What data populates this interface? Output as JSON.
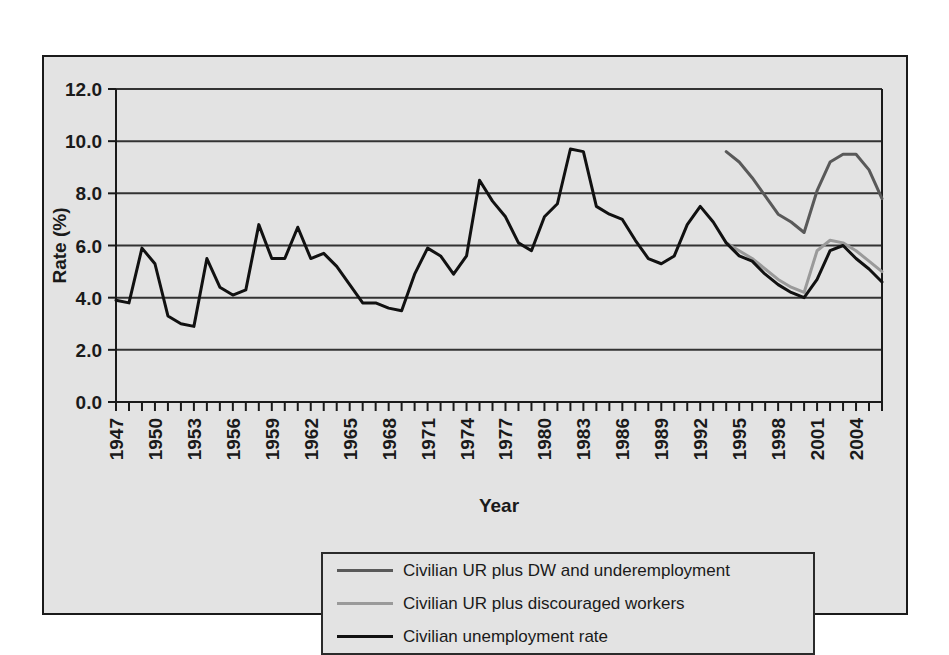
{
  "chart_data": {
    "type": "line",
    "title": "",
    "xlabel": "Year",
    "ylabel": "Rate (%)",
    "xlim": [
      1947,
      2006
    ],
    "ylim": [
      0.0,
      12.0
    ],
    "ytick_values": [
      0.0,
      2.0,
      4.0,
      6.0,
      8.0,
      10.0,
      12.0
    ],
    "ytick_labels": [
      "0.0",
      "2.0",
      "4.0",
      "6.0",
      "8.0",
      "10.0",
      "12.0"
    ],
    "xtick_labels": [
      "1947",
      "1950",
      "1953",
      "1956",
      "1959",
      "1962",
      "1965",
      "1968",
      "1971",
      "1974",
      "1977",
      "1980",
      "1983",
      "1986",
      "1989",
      "1992",
      "1995",
      "1998",
      "2001",
      "2004"
    ],
    "xtick_step": 3,
    "xtick_rotation": 90,
    "minor_tick_step": 1,
    "grid": "horizontal",
    "legend_position": "below-axes",
    "series": [
      {
        "name": "Civilian UR plus DW and underemployment",
        "color": "#595959",
        "x": [
          1994,
          1995,
          1996,
          1997,
          1998,
          1999,
          2000,
          2001,
          2002,
          2003,
          2004,
          2005,
          2006
        ],
        "values": [
          9.6,
          9.2,
          8.6,
          7.9,
          7.2,
          6.9,
          6.5,
          8.1,
          9.2,
          9.5,
          9.5,
          8.9,
          7.8
        ]
      },
      {
        "name": "Civilian UR plus discouraged workers",
        "color": "#9a9a9a",
        "x": [
          1994,
          1995,
          1996,
          1997,
          1998,
          1999,
          2000,
          2001,
          2002,
          2003,
          2004,
          2005,
          2006
        ],
        "values": [
          6.1,
          5.8,
          5.5,
          5.1,
          4.7,
          4.4,
          4.2,
          5.8,
          6.2,
          6.1,
          5.8,
          5.4,
          5.0
        ]
      },
      {
        "name": "Civilian unemployment rate",
        "color": "#111111",
        "x": [
          1947,
          1948,
          1949,
          1950,
          1951,
          1952,
          1953,
          1954,
          1955,
          1956,
          1957,
          1958,
          1959,
          1960,
          1961,
          1962,
          1963,
          1964,
          1965,
          1966,
          1967,
          1968,
          1969,
          1970,
          1971,
          1972,
          1973,
          1974,
          1975,
          1976,
          1977,
          1978,
          1979,
          1980,
          1981,
          1982,
          1983,
          1984,
          1985,
          1986,
          1987,
          1988,
          1989,
          1990,
          1991,
          1992,
          1993,
          1994,
          1995,
          1996,
          1997,
          1998,
          1999,
          2000,
          2001,
          2002,
          2003,
          2004,
          2005,
          2006
        ],
        "values": [
          3.9,
          3.8,
          5.9,
          5.3,
          3.3,
          3.0,
          2.9,
          5.5,
          4.4,
          4.1,
          4.3,
          6.8,
          5.5,
          5.5,
          6.7,
          5.5,
          5.7,
          5.2,
          4.5,
          3.8,
          3.8,
          3.6,
          3.5,
          4.9,
          5.9,
          5.6,
          4.9,
          5.6,
          8.5,
          7.7,
          7.1,
          6.1,
          5.8,
          7.1,
          7.6,
          9.7,
          9.6,
          7.5,
          7.2,
          7.0,
          6.2,
          5.5,
          5.3,
          5.6,
          6.8,
          7.5,
          6.9,
          6.1,
          5.6,
          5.4,
          4.9,
          4.5,
          4.2,
          4.0,
          4.7,
          5.8,
          6.0,
          5.5,
          5.1,
          4.6
        ]
      }
    ]
  },
  "legend": {
    "entries": [
      {
        "label": "Civilian UR plus DW and underemployment",
        "color": "#595959"
      },
      {
        "label": "Civilian UR plus discouraged workers",
        "color": "#9a9a9a"
      },
      {
        "label": "Civilian unemployment rate",
        "color": "#111111"
      }
    ]
  },
  "colors": {
    "page_background": "#ffffff",
    "panel_background": "#e3e3e3",
    "frame": "#1a1a1a",
    "gridline": "#333333",
    "axis": "#1a1a1a"
  }
}
